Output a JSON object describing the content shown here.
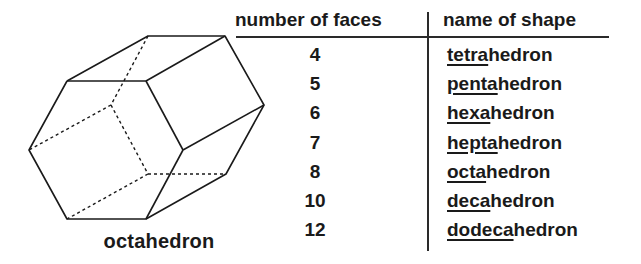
{
  "figure": {
    "shape_caption": "octahedron",
    "table": {
      "headers": {
        "faces": "number of faces",
        "name": "name of shape"
      },
      "rows": [
        {
          "faces": "4",
          "prefix": "tetra",
          "suffix": "hedron"
        },
        {
          "faces": "5",
          "prefix": "penta",
          "suffix": "hedron"
        },
        {
          "faces": "6",
          "prefix": "hexa",
          "suffix": "hedron"
        },
        {
          "faces": "7",
          "prefix": "hepta",
          "suffix": "hedron"
        },
        {
          "faces": "8",
          "prefix": "octa",
          "suffix": "hedron"
        },
        {
          "faces": "10",
          "prefix": "deca",
          "suffix": "hedron"
        },
        {
          "faces": "12",
          "prefix": "dodeca",
          "suffix": "hedron"
        }
      ]
    },
    "colors": {
      "ink": "#1a1a1a",
      "background": "#ffffff"
    }
  }
}
